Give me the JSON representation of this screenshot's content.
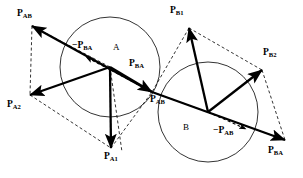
{
  "figure": {
    "background_color": "#ffffff",
    "stroke_color": "#000000",
    "width": 303,
    "height": 178
  },
  "bodies": [
    {
      "name": "body-a",
      "label": "A",
      "cx": 110,
      "cy": 67,
      "r": 50,
      "label_x": 113,
      "label_y": 43
    },
    {
      "name": "body-b",
      "label": "B",
      "cx": 208,
      "cy": 112,
      "r": 50,
      "label_x": 183,
      "label_y": 123
    }
  ],
  "vertices": {
    "a_center": {
      "x": 110,
      "y": 67
    },
    "b_center": {
      "x": 208,
      "y": 112
    },
    "junction": {
      "x": 152,
      "y": 92
    }
  },
  "vectors": [
    {
      "name": "vector-p-ab-upleft",
      "label": "P",
      "sub": "AB",
      "x1": 152,
      "y1": 92,
      "x2": 32,
      "y2": 26,
      "label_x": 17,
      "label_y": 9,
      "style": "solid"
    },
    {
      "name": "vector-neg-p-ba",
      "label": "−P",
      "sub": "BA",
      "x1": 152,
      "y1": 92,
      "x2": 86,
      "y2": 57,
      "label_x": 72,
      "label_y": 41,
      "style": "dashed"
    },
    {
      "name": "vector-p-a2",
      "label": "P",
      "sub": "A2",
      "x1": 110,
      "y1": 67,
      "x2": 30,
      "y2": 95,
      "label_x": 7,
      "label_y": 100,
      "style": "solid"
    },
    {
      "name": "vector-p-a1",
      "label": "P",
      "sub": "A1",
      "x1": 110,
      "y1": 67,
      "x2": 111,
      "y2": 148,
      "label_x": 104,
      "label_y": 152,
      "style": "solid"
    },
    {
      "name": "vector-p-ba-center",
      "label": "P",
      "sub": "BA",
      "x1": 110,
      "y1": 67,
      "x2": 152,
      "y2": 92,
      "label_x": 129,
      "label_y": 59,
      "style": "solid"
    },
    {
      "name": "vector-p-ab-junction",
      "label": "P",
      "sub": "AB",
      "label_x": 150,
      "label_y": 95,
      "style": "label-only"
    },
    {
      "name": "vector-p-b1",
      "label": "P",
      "sub": "B1",
      "x1": 208,
      "y1": 112,
      "x2": 189,
      "y2": 28,
      "label_x": 170,
      "label_y": 6,
      "style": "solid"
    },
    {
      "name": "vector-p-b2",
      "label": "P",
      "sub": "B2",
      "x1": 208,
      "y1": 112,
      "x2": 262,
      "y2": 70,
      "label_x": 263,
      "label_y": 48,
      "style": "solid"
    },
    {
      "name": "vector-neg-p-ab",
      "label": "−P",
      "sub": "AB",
      "x1": 208,
      "y1": 112,
      "x2": 246,
      "y2": 129,
      "label_x": 213,
      "label_y": 126,
      "style": "dashed"
    },
    {
      "name": "vector-p-ba-lower",
      "label": "P",
      "sub": "BA",
      "x1": 152,
      "y1": 92,
      "x2": 285,
      "y2": 140,
      "label_x": 268,
      "label_y": 146,
      "style": "solid"
    }
  ],
  "construction_lines": [
    {
      "name": "dash-pab-to-pa2",
      "x1": 32,
      "y1": 26,
      "x2": 30,
      "y2": 95
    },
    {
      "name": "dash-pa2-to-pa1",
      "x1": 30,
      "y1": 95,
      "x2": 111,
      "y2": 148
    },
    {
      "name": "dash-pab-parallel",
      "x1": 110,
      "y1": 67,
      "x2": 32,
      "y2": 26
    },
    {
      "name": "dash-pa1-diag",
      "x1": 110,
      "y1": 67,
      "x2": 122,
      "y2": 152
    },
    {
      "name": "dash-pa1-to-junction",
      "x1": 111,
      "y1": 148,
      "x2": 152,
      "y2": 92
    },
    {
      "name": "dash-pb1-to-junction",
      "x1": 189,
      "y1": 28,
      "x2": 152,
      "y2": 92
    },
    {
      "name": "dash-pb1-to-pb2",
      "x1": 189,
      "y1": 28,
      "x2": 262,
      "y2": 70
    },
    {
      "name": "dash-pb2-to-pba",
      "x1": 262,
      "y1": 70,
      "x2": 285,
      "y2": 140
    },
    {
      "name": "dash-junction-to-pba",
      "x1": 152,
      "y1": 92,
      "x2": 285,
      "y2": 140
    }
  ]
}
